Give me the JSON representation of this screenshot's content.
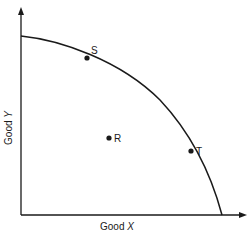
{
  "diagram": {
    "type": "production-possibilities-frontier",
    "x_axis_label": "Good",
    "x_axis_var": "X",
    "y_axis_label": "Good",
    "y_axis_var": "Y",
    "points": [
      {
        "label": "S",
        "position": "on curve, upper left"
      },
      {
        "label": "R",
        "position": "inside curve"
      },
      {
        "label": "T",
        "position": "on curve, lower right"
      }
    ],
    "colors": {
      "line": "#1a1a1a",
      "background": "#ffffff"
    }
  }
}
